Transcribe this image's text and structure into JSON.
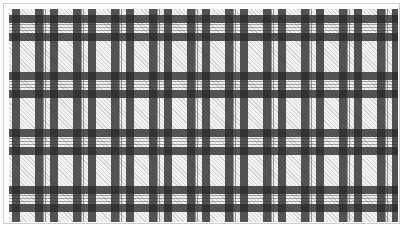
{
  "image": {
    "description": "Black, gray and white plaid (tartan) fabric pattern inside a thin light-gray frame",
    "colors": {
      "dark_band": "#3a3a3a",
      "light_ground": "#f4f4f4",
      "frame_border": "#cfcfcf",
      "background": "#ffffff"
    },
    "pattern": {
      "horizontal_repeat_px": 38,
      "vertical_repeat_px": 57,
      "band_width_px": 8
    }
  }
}
